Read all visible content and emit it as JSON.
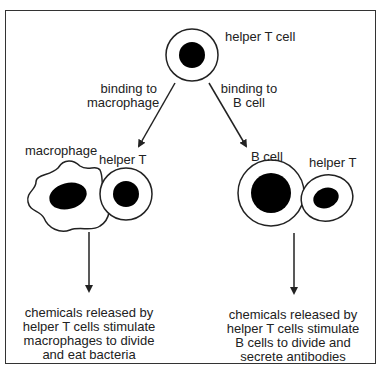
{
  "labels": {
    "top_cell": "helper T cell",
    "binding_macrophage_line1": "binding to",
    "binding_macrophage_line2": "macrophage",
    "binding_bcell_line1": "binding to",
    "binding_bcell_line2": "B cell",
    "macrophage": "macrophage",
    "helper_t_left": "helper T",
    "b_cell": "B cell",
    "helper_t_right": "helper T"
  },
  "outcomes": {
    "left": [
      "chemicals released by",
      "helper T cells stimulate",
      "macrophages to divide",
      "and eat bacteria"
    ],
    "right": [
      "chemicals released by",
      "helper T cells stimulate",
      "B cells to divide and",
      "secrete antibodies"
    ]
  },
  "colors": {
    "stroke": "#222222",
    "nucleus": "#000000",
    "background": "#ffffff"
  }
}
